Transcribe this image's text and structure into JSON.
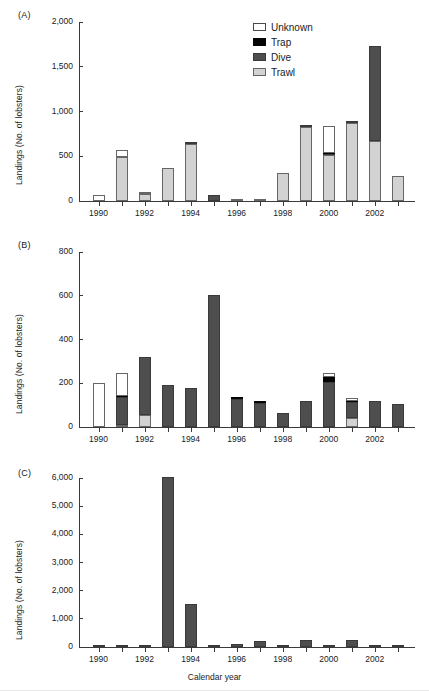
{
  "figure": {
    "xlabel": "Calendar year",
    "ylabel": "Landings (No. of lobsters)",
    "panel_tags": [
      "(A)",
      "(B)",
      "(C)"
    ]
  },
  "legend": {
    "position": "top-right-panel-A",
    "entries": [
      {
        "label": "Unknown",
        "key": "unknown",
        "color": "#ffffff"
      },
      {
        "label": "Trap",
        "key": "trap",
        "color": "#050505"
      },
      {
        "label": "Dive",
        "key": "dive",
        "color": "#4e4e4e"
      },
      {
        "label": "Trawl",
        "key": "trawl",
        "color": "#d2d2d2"
      }
    ]
  },
  "chart_data": [
    {
      "type": "bar",
      "panel": "(A)",
      "stacked": true,
      "title": "",
      "xlabel": "",
      "ylabel": "Landings (No. of lobsters)",
      "ylim": [
        0,
        2000
      ],
      "yticks": [
        0,
        500,
        1000,
        1500,
        2000
      ],
      "ytick_labels": [
        "0",
        "500",
        "1,000",
        "1,500",
        "2,000"
      ],
      "grid": false,
      "categories": [
        1990,
        1991,
        1992,
        1993,
        1994,
        1995,
        1996,
        1997,
        1998,
        1999,
        2000,
        2001,
        2002,
        2003
      ],
      "xtick_labels": [
        "1990",
        "1992",
        "1994",
        "1996",
        "1998",
        "2000",
        "2002"
      ],
      "series": [
        {
          "name": "Trawl",
          "values": [
            0,
            495,
            75,
            370,
            635,
            0,
            10,
            12,
            310,
            830,
            510,
            875,
            665,
            275
          ]
        },
        {
          "name": "Dive",
          "values": [
            0,
            0,
            0,
            0,
            25,
            65,
            0,
            0,
            0,
            12,
            12,
            15,
            1070,
            0
          ]
        },
        {
          "name": "Trap",
          "values": [
            0,
            0,
            0,
            0,
            0,
            0,
            0,
            0,
            0,
            0,
            10,
            0,
            0,
            0
          ]
        },
        {
          "name": "Unknown",
          "values": [
            70,
            80,
            8,
            0,
            0,
            0,
            0,
            0,
            0,
            0,
            310,
            0,
            0,
            0
          ]
        }
      ],
      "totals": [
        70,
        575,
        83,
        370,
        660,
        65,
        10,
        12,
        310,
        842,
        842,
        890,
        1735,
        275
      ]
    },
    {
      "type": "bar",
      "panel": "(B)",
      "stacked": true,
      "title": "",
      "xlabel": "",
      "ylabel": "Landings (No. of lobsters)",
      "ylim": [
        0,
        800
      ],
      "yticks": [
        0,
        200,
        400,
        600,
        800
      ],
      "ytick_labels": [
        "0",
        "200",
        "400",
        "600",
        "800"
      ],
      "grid": false,
      "categories": [
        1990,
        1991,
        1992,
        1993,
        1994,
        1995,
        1996,
        1997,
        1998,
        1999,
        2000,
        2001,
        2002,
        2003
      ],
      "xtick_labels": [
        "1990",
        "1992",
        "1994",
        "1996",
        "1998",
        "2000",
        "2002"
      ],
      "series": [
        {
          "name": "Trawl",
          "values": [
            0,
            10,
            55,
            0,
            0,
            0,
            0,
            0,
            0,
            0,
            0,
            42,
            0,
            0
          ]
        },
        {
          "name": "Dive",
          "values": [
            0,
            125,
            265,
            192,
            180,
            605,
            128,
            108,
            66,
            118,
            205,
            73,
            120,
            105
          ]
        },
        {
          "name": "Trap",
          "values": [
            0,
            8,
            0,
            0,
            0,
            0,
            5,
            5,
            0,
            0,
            22,
            5,
            0,
            0
          ]
        },
        {
          "name": "Unknown",
          "values": [
            202,
            103,
            0,
            0,
            0,
            0,
            0,
            0,
            0,
            0,
            18,
            12,
            0,
            0
          ]
        }
      ],
      "totals": [
        202,
        246,
        320,
        192,
        180,
        605,
        133,
        113,
        66,
        118,
        245,
        132,
        120,
        105
      ]
    },
    {
      "type": "bar",
      "panel": "(C)",
      "stacked": true,
      "title": "",
      "xlabel": "Calendar year",
      "ylabel": "Landings (No. of lobsters)",
      "ylim": [
        0,
        6000
      ],
      "yticks": [
        0,
        1000,
        2000,
        3000,
        4000,
        5000,
        6000
      ],
      "ytick_labels": [
        "0",
        "1,000",
        "2,000",
        "3,000",
        "4,000",
        "5,000",
        "6,000"
      ],
      "grid": false,
      "categories": [
        1990,
        1991,
        1992,
        1993,
        1994,
        1995,
        1996,
        1997,
        1998,
        1999,
        2000,
        2001,
        2002,
        2003
      ],
      "xtick_labels": [
        "1990",
        "1992",
        "1994",
        "1996",
        "1998",
        "2000",
        "2002"
      ],
      "series": [
        {
          "name": "Trawl",
          "values": [
            0,
            0,
            0,
            0,
            0,
            0,
            0,
            0,
            0,
            0,
            0,
            0,
            0,
            0
          ]
        },
        {
          "name": "Dive",
          "values": [
            20,
            70,
            30,
            6050,
            1520,
            55,
            100,
            205,
            35,
            250,
            20,
            245,
            25,
            80
          ]
        },
        {
          "name": "Trap",
          "values": [
            0,
            0,
            0,
            0,
            0,
            0,
            0,
            0,
            0,
            0,
            0,
            0,
            0,
            0
          ]
        },
        {
          "name": "Unknown",
          "values": [
            0,
            0,
            0,
            0,
            0,
            0,
            0,
            0,
            0,
            0,
            0,
            0,
            0,
            0
          ]
        }
      ],
      "totals": [
        20,
        70,
        30,
        6050,
        1520,
        55,
        100,
        205,
        35,
        250,
        20,
        245,
        25,
        80
      ]
    }
  ]
}
